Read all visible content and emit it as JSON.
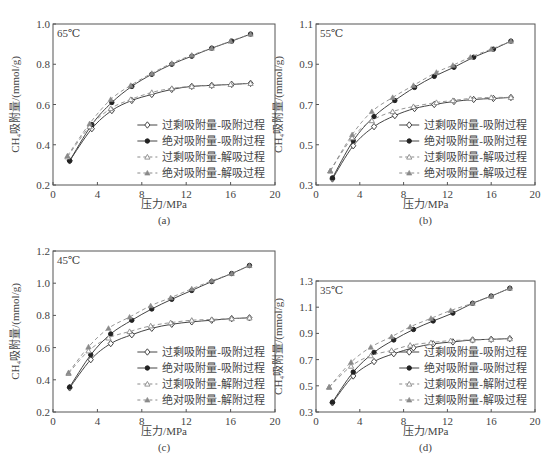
{
  "figure": {
    "x_label": "压力/MPa",
    "y_label": "CH₄吸附量/(mmol/g)"
  },
  "chart_data": [
    {
      "id": "a",
      "type": "line",
      "caption": "(a)",
      "annotation": "65℃",
      "xlabel": "压力/MPa",
      "ylabel": "CH4吸附量/(mmol/g)",
      "xlim": [
        0,
        20
      ],
      "ylim": [
        0.2,
        1.0
      ],
      "xticks": [
        0,
        4,
        8,
        12,
        16,
        20
      ],
      "yticks": [
        0.2,
        0.4,
        0.6,
        0.8,
        1.0
      ],
      "ytick_labels": [
        "0.2",
        "0.4",
        "0.6",
        "0.8",
        "1.0"
      ],
      "grid": false,
      "legend_position": "lower right",
      "series": [
        {
          "name": "过剩吸附量-吸附过程",
          "style": "solid",
          "marker": "open-diamond",
          "x": [
            1.5,
            3.5,
            5.3,
            7.1,
            8.9,
            10.7,
            12.5,
            14.3,
            16.1,
            17.8
          ],
          "y": [
            0.32,
            0.48,
            0.57,
            0.62,
            0.65,
            0.675,
            0.69,
            0.695,
            0.7,
            0.705
          ]
        },
        {
          "name": "绝对吸附量-吸附过程",
          "style": "solid",
          "marker": "filled-circle",
          "x": [
            1.5,
            3.5,
            5.3,
            7.1,
            8.9,
            10.7,
            12.5,
            14.3,
            16.1,
            17.8
          ],
          "y": [
            0.32,
            0.5,
            0.61,
            0.69,
            0.75,
            0.8,
            0.84,
            0.88,
            0.915,
            0.95
          ]
        },
        {
          "name": "过剩吸附量-解吸过程",
          "style": "dashed",
          "marker": "open-triangle",
          "x": [
            1.3,
            3.3,
            5.2,
            7.0,
            8.9,
            10.7,
            12.5,
            14.3,
            16.0,
            17.8
          ],
          "y": [
            0.34,
            0.49,
            0.58,
            0.625,
            0.66,
            0.68,
            0.69,
            0.695,
            0.7,
            0.705
          ]
        },
        {
          "name": "绝对吸附量-解吸过程",
          "style": "dashed",
          "marker": "filled-triangle",
          "x": [
            1.3,
            3.3,
            5.2,
            7.0,
            8.9,
            10.7,
            12.5,
            14.3,
            16.0,
            17.8
          ],
          "y": [
            0.345,
            0.505,
            0.625,
            0.695,
            0.755,
            0.805,
            0.845,
            0.88,
            0.915,
            0.95
          ]
        }
      ]
    },
    {
      "id": "b",
      "type": "line",
      "caption": "(b)",
      "annotation": "55℃",
      "xlabel": "压力/MPa",
      "ylabel": "CH4吸附量/(mmol/g)",
      "xlim": [
        0,
        20
      ],
      "ylim": [
        0.3,
        1.1
      ],
      "xticks": [
        0,
        4,
        8,
        12,
        16,
        20
      ],
      "yticks": [
        0.3,
        0.5,
        0.7,
        0.9,
        1.1
      ],
      "ytick_labels": [
        "0.3",
        "0.5",
        "0.7",
        "0.9",
        "1.1"
      ],
      "grid": false,
      "legend_position": "lower right",
      "series": [
        {
          "name": "过剩吸附量-吸附过程",
          "style": "solid",
          "marker": "open-diamond",
          "x": [
            1.5,
            3.4,
            5.3,
            7.2,
            9.0,
            10.8,
            12.6,
            14.4,
            16.2,
            17.8
          ],
          "y": [
            0.33,
            0.495,
            0.59,
            0.645,
            0.68,
            0.7,
            0.715,
            0.725,
            0.73,
            0.735
          ]
        },
        {
          "name": "绝对吸附量-吸附过程",
          "style": "solid",
          "marker": "filled-circle",
          "x": [
            1.5,
            3.4,
            5.3,
            7.2,
            9.0,
            10.8,
            12.6,
            14.4,
            16.2,
            17.8
          ],
          "y": [
            0.335,
            0.52,
            0.64,
            0.72,
            0.785,
            0.84,
            0.885,
            0.935,
            0.975,
            1.015
          ]
        },
        {
          "name": "过剩吸附量-解吸过程",
          "style": "dashed",
          "marker": "open-triangle",
          "x": [
            1.3,
            3.3,
            5.1,
            7.0,
            8.9,
            11.0,
            12.5,
            14.1,
            16.0,
            17.8
          ],
          "y": [
            0.37,
            0.535,
            0.62,
            0.665,
            0.69,
            0.71,
            0.72,
            0.73,
            0.735,
            0.735
          ]
        },
        {
          "name": "绝对吸附量-解吸过程",
          "style": "dashed",
          "marker": "filled-triangle",
          "x": [
            1.3,
            3.3,
            5.1,
            7.0,
            8.9,
            11.0,
            12.5,
            14.1,
            16.0,
            17.8
          ],
          "y": [
            0.37,
            0.55,
            0.665,
            0.735,
            0.795,
            0.86,
            0.895,
            0.935,
            0.975,
            1.015
          ]
        }
      ]
    },
    {
      "id": "c",
      "type": "line",
      "caption": "(c)",
      "annotation": "45℃",
      "xlabel": "压力/MPa",
      "ylabel": "CH4吸附量/(mmol/g)",
      "xlim": [
        0,
        20
      ],
      "ylim": [
        0.2,
        1.2
      ],
      "xticks": [
        0,
        4,
        8,
        12,
        16,
        20
      ],
      "yticks": [
        0.2,
        0.4,
        0.6,
        0.8,
        1.0,
        1.2
      ],
      "ytick_labels": [
        "0.2",
        "0.4",
        "0.6",
        "0.8",
        "1.0",
        "1.2"
      ],
      "grid": false,
      "legend_position": "lower right",
      "series": [
        {
          "name": "过剩吸附量-吸附过程",
          "style": "solid",
          "marker": "open-diamond",
          "x": [
            1.5,
            3.4,
            5.2,
            7.1,
            8.9,
            10.7,
            12.5,
            14.3,
            16.1,
            17.7
          ],
          "y": [
            0.35,
            0.525,
            0.625,
            0.68,
            0.72,
            0.745,
            0.76,
            0.77,
            0.78,
            0.785
          ]
        },
        {
          "name": "绝对吸附量-吸附过程",
          "style": "solid",
          "marker": "filled-circle",
          "x": [
            1.5,
            3.4,
            5.2,
            7.1,
            8.9,
            10.7,
            12.5,
            14.3,
            16.1,
            17.7
          ],
          "y": [
            0.355,
            0.555,
            0.685,
            0.77,
            0.84,
            0.9,
            0.955,
            1.01,
            1.06,
            1.11
          ]
        },
        {
          "name": "过剩吸附量-解附过程",
          "style": "dashed",
          "marker": "open-triangle",
          "x": [
            1.4,
            3.2,
            5.0,
            6.9,
            8.8,
            10.6,
            12.5,
            14.3,
            16.1,
            17.7
          ],
          "y": [
            0.44,
            0.58,
            0.66,
            0.7,
            0.735,
            0.755,
            0.77,
            0.775,
            0.78,
            0.785
          ]
        },
        {
          "name": "绝对吸附量-解附过程",
          "style": "dashed",
          "marker": "filled-triangle",
          "x": [
            1.4,
            3.2,
            5.0,
            6.9,
            8.8,
            10.6,
            12.5,
            14.3,
            16.1,
            17.7
          ],
          "y": [
            0.445,
            0.605,
            0.72,
            0.79,
            0.86,
            0.91,
            0.965,
            1.015,
            1.06,
            1.11
          ]
        }
      ]
    },
    {
      "id": "d",
      "type": "line",
      "caption": "(d)",
      "annotation": "35℃",
      "xlabel": "压力/MPa",
      "ylabel": "CH4吸附量/(mmol/g)",
      "xlim": [
        0,
        20
      ],
      "ylim": [
        0.3,
        1.3
      ],
      "xticks": [
        0,
        4,
        8,
        12,
        16,
        20
      ],
      "yticks": [
        0.3,
        0.5,
        0.7,
        0.9,
        1.1,
        1.3
      ],
      "ytick_labels": [
        "0.3",
        "0.5",
        "0.7",
        "0.9",
        "1.1",
        "1.3"
      ],
      "grid": false,
      "legend_position": "lower right",
      "series": [
        {
          "name": "过剩吸附量-吸附过程",
          "style": "solid",
          "marker": "open-diamond",
          "x": [
            1.5,
            3.4,
            5.3,
            7.1,
            8.9,
            10.7,
            12.5,
            14.3,
            16.0,
            17.7
          ],
          "y": [
            0.37,
            0.575,
            0.685,
            0.745,
            0.79,
            0.82,
            0.835,
            0.85,
            0.855,
            0.86
          ]
        },
        {
          "name": "绝对吸附量-吸附过程",
          "style": "solid",
          "marker": "filled-circle",
          "x": [
            1.5,
            3.4,
            5.3,
            7.1,
            8.9,
            10.7,
            12.5,
            14.3,
            16.0,
            17.7
          ],
          "y": [
            0.375,
            0.605,
            0.755,
            0.85,
            0.93,
            0.995,
            1.055,
            1.13,
            1.185,
            1.245
          ]
        },
        {
          "name": "过剩吸附量-解附过程",
          "style": "dashed",
          "marker": "open-triangle",
          "x": [
            1.2,
            3.2,
            5.0,
            6.9,
            8.6,
            10.5,
            12.3,
            14.3,
            16.0,
            17.7
          ],
          "y": [
            0.49,
            0.65,
            0.73,
            0.77,
            0.81,
            0.83,
            0.845,
            0.85,
            0.855,
            0.86
          ]
        },
        {
          "name": "过剩吸附量-解吸过程",
          "style": "dashed",
          "marker": "filled-triangle",
          "x": [
            1.2,
            3.2,
            5.0,
            6.9,
            8.6,
            10.5,
            12.3,
            14.3,
            16.0,
            17.7
          ],
          "y": [
            0.49,
            0.68,
            0.795,
            0.875,
            0.95,
            1.015,
            1.075,
            1.13,
            1.185,
            1.245
          ]
        }
      ]
    }
  ],
  "colors": {
    "axis": "#555555",
    "series_solid": "#444444",
    "series_dashed": "#8a8a8a",
    "text": "#444444"
  },
  "layout": [
    {
      "left": 53,
      "top": 24,
      "right": 275,
      "bottom": 185,
      "caption_y": 224,
      "xlabel_y": 208
    },
    {
      "left": 316,
      "top": 24,
      "right": 535,
      "bottom": 185,
      "caption_y": 224,
      "xlabel_y": 208
    },
    {
      "left": 53,
      "top": 251,
      "right": 275,
      "bottom": 412,
      "caption_y": 451,
      "xlabel_y": 435
    },
    {
      "left": 316,
      "top": 281,
      "right": 535,
      "bottom": 412,
      "caption_y": 451,
      "xlabel_y": 435
    }
  ]
}
